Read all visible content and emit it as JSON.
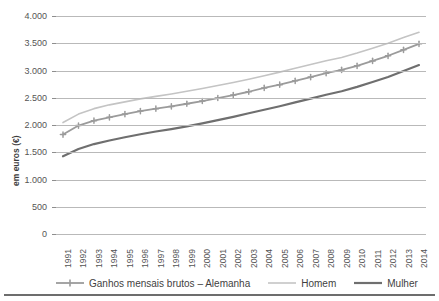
{
  "chart_data": {
    "type": "line",
    "title": "",
    "xlabel": "",
    "ylabel": "em euros (€)",
    "ylim": [
      0,
      4000
    ],
    "ytick_labels": [
      "4.000",
      "3.500",
      "3.000",
      "2.500",
      "2.000",
      "1.500",
      "1.000",
      "500",
      "0"
    ],
    "ytick_values": [
      4000,
      3500,
      3000,
      2500,
      2000,
      1500,
      1000,
      500,
      0
    ],
    "grid": true,
    "legend_position": "bottom",
    "categories": [
      "1991",
      "1992",
      "1993",
      "1994",
      "1995",
      "1996",
      "1997",
      "1998",
      "1999",
      "2000",
      "2001",
      "2002",
      "2003",
      "2004",
      "2005",
      "2006",
      "2007",
      "2008",
      "2009",
      "2010",
      "2011",
      "2012",
      "2013",
      "2014"
    ],
    "series": [
      {
        "name": "Ganhos mensais brutos – Alemanha",
        "color": "#9b9b9b",
        "marker": "cross",
        "width": 1.8,
        "values": [
          1825,
          1990,
          2080,
          2140,
          2200,
          2255,
          2300,
          2340,
          2390,
          2440,
          2495,
          2550,
          2610,
          2680,
          2740,
          2810,
          2880,
          2950,
          3010,
          3085,
          3175,
          3270,
          3380,
          3490
        ]
      },
      {
        "name": "Homem",
        "color": "#c4c4c4",
        "marker": "none",
        "width": 1.6,
        "values": [
          2045,
          2200,
          2300,
          2370,
          2425,
          2480,
          2525,
          2570,
          2620,
          2670,
          2725,
          2780,
          2840,
          2905,
          2970,
          3040,
          3110,
          3180,
          3240,
          3320,
          3410,
          3500,
          3605,
          3700
        ]
      },
      {
        "name": "Mulher",
        "color": "#6f6f6f",
        "marker": "none",
        "width": 2.2,
        "values": [
          1425,
          1560,
          1650,
          1715,
          1775,
          1830,
          1880,
          1925,
          1975,
          2030,
          2090,
          2150,
          2215,
          2280,
          2345,
          2415,
          2485,
          2555,
          2620,
          2700,
          2790,
          2880,
          2990,
          3100
        ]
      }
    ]
  },
  "legend": {
    "items": [
      {
        "label": "Ganhos mensais brutos – Alemanha"
      },
      {
        "label": "Homem"
      },
      {
        "label": "Mulher"
      }
    ]
  }
}
